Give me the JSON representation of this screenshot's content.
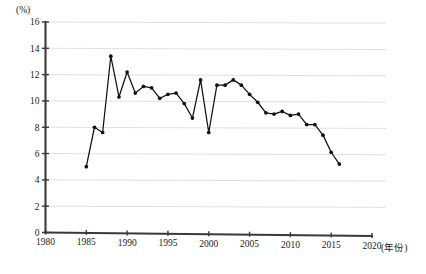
{
  "chart_data": {
    "type": "line",
    "title": "",
    "subtitle": "",
    "xlabel": "(年份)",
    "ylabel": "(%)",
    "xlim": [
      1980,
      2020
    ],
    "ylim": [
      0,
      16
    ],
    "grid": true,
    "legend_position": "none",
    "x_ticks": [
      1980,
      1985,
      1990,
      1995,
      2000,
      2005,
      2010,
      2015,
      2020
    ],
    "y_ticks": [
      0,
      2,
      4,
      6,
      8,
      10,
      12,
      14,
      16
    ],
    "x_tick_labels": [
      "1980",
      "1985",
      "1990",
      "1995",
      "2000",
      "2005",
      "2010",
      "2015",
      "2020"
    ],
    "y_tick_labels": [
      "0",
      "2",
      "4",
      "6",
      "8",
      "10",
      "12",
      "14",
      "16"
    ],
    "marker": "circle",
    "line_color": "#111111",
    "marker_color": "#111111",
    "grid_color": "#dedede",
    "axis_color": "#3a3a3a",
    "x": [
      1985,
      1986,
      1987,
      1988,
      1989,
      1990,
      1991,
      1992,
      1993,
      1994,
      1995,
      1996,
      1997,
      1998,
      1999,
      2000,
      2001,
      2002,
      2003,
      2004,
      2005,
      2006,
      2007,
      2008,
      2009,
      2010,
      2011,
      2012,
      2013,
      2014,
      2015,
      2016
    ],
    "values": [
      5.0,
      8.0,
      7.6,
      13.4,
      10.3,
      12.2,
      10.6,
      11.1,
      11.0,
      10.2,
      10.5,
      10.6,
      9.8,
      8.7,
      11.6,
      7.6,
      11.2,
      11.2,
      11.6,
      11.2,
      10.5,
      9.9,
      9.1,
      9.0,
      9.2,
      8.9,
      9.0,
      8.2,
      8.2,
      7.4,
      6.1,
      5.2
    ],
    "series": [
      {
        "name": "",
        "values": [
          5.0,
          8.0,
          7.6,
          13.4,
          10.3,
          12.2,
          10.6,
          11.1,
          11.0,
          10.2,
          10.5,
          10.6,
          9.8,
          8.7,
          11.6,
          7.6,
          11.2,
          11.2,
          11.6,
          11.2,
          10.5,
          9.9,
          9.1,
          9.0,
          9.2,
          8.9,
          9.0,
          8.2,
          8.2,
          7.4,
          6.1,
          5.2
        ]
      }
    ]
  }
}
